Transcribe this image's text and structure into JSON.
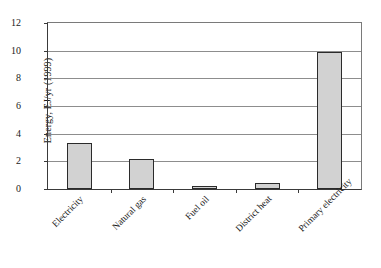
{
  "chart_data": {
    "type": "bar",
    "title": "",
    "xlabel": "",
    "ylabel": "Energy, EJ/yr (1999)",
    "categories": [
      "Electricity",
      "Natural gas",
      "Fuel oil",
      "District heat",
      "Primary electricity"
    ],
    "values": [
      3.3,
      2.15,
      0.2,
      0.45,
      9.9
    ],
    "ylim": [
      0,
      12
    ],
    "ytick_labels": [
      "0",
      "2",
      "4",
      "6",
      "8",
      "10",
      "12"
    ],
    "ytick_values": [
      0,
      2,
      4,
      6,
      8,
      10,
      12
    ],
    "grid": "horizontal",
    "legend": "none",
    "bar_fill_color": "#d2d2d2",
    "bar_edge_color": "#2b2b2b",
    "grid_color": "#8d8d8d",
    "axis_color": "#3a3a3a"
  }
}
